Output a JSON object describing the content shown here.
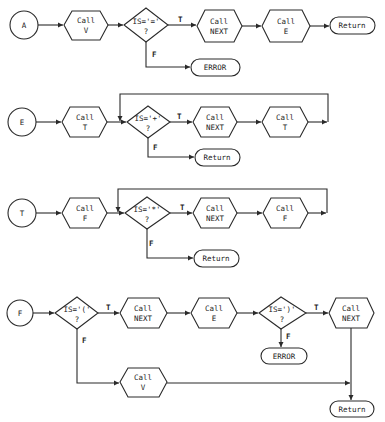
{
  "diagram": {
    "type": "flowchart",
    "edge_labels": {
      "true": "T",
      "false": "F"
    },
    "procedures": [
      {
        "id": "A",
        "entry": "A",
        "nodes": {
          "call_v": {
            "line1": "Call",
            "line2": "V"
          },
          "decision": {
            "line1": "IS='='",
            "line2": "?"
          },
          "call_next": {
            "line1": "Call",
            "line2": "NEXT"
          },
          "call_e": {
            "line1": "Call",
            "line2": "E"
          },
          "return": "Return",
          "error": "ERROR"
        }
      },
      {
        "id": "E",
        "entry": "E",
        "nodes": {
          "call_t": {
            "line1": "Call",
            "line2": "T"
          },
          "decision": {
            "line1": "IS='+'",
            "line2": "?"
          },
          "call_next": {
            "line1": "Call",
            "line2": "NEXT"
          },
          "call_t2": {
            "line1": "Call",
            "line2": "T"
          },
          "return": "Return"
        }
      },
      {
        "id": "T",
        "entry": "T",
        "nodes": {
          "call_f": {
            "line1": "Call",
            "line2": "F"
          },
          "decision": {
            "line1": "IS='*'",
            "line2": "?"
          },
          "call_next": {
            "line1": "Call",
            "line2": "NEXT"
          },
          "call_f2": {
            "line1": "Call",
            "line2": "F"
          },
          "return": "Return"
        }
      },
      {
        "id": "F",
        "entry": "F",
        "nodes": {
          "decision1": {
            "line1": "IS='('",
            "line2": "?"
          },
          "call_next": {
            "line1": "Call",
            "line2": "NEXT"
          },
          "call_e": {
            "line1": "Call",
            "line2": "E"
          },
          "decision2": {
            "line1": "IS=')'",
            "line2": "?"
          },
          "call_next2": {
            "line1": "Call",
            "line2": "NEXT"
          },
          "error": "ERROR",
          "call_v": {
            "line1": "Call",
            "line2": "V"
          },
          "return": "Return"
        }
      }
    ]
  }
}
